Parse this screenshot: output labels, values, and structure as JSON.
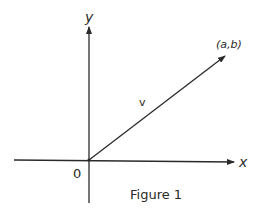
{
  "figure": {
    "caption": "Figure 1",
    "x_axis_label": "x",
    "y_axis_label": "y",
    "origin_label": "0",
    "vector_label": "v",
    "point_label": "(a,b)",
    "ink_color": "#2a2a2a"
  }
}
